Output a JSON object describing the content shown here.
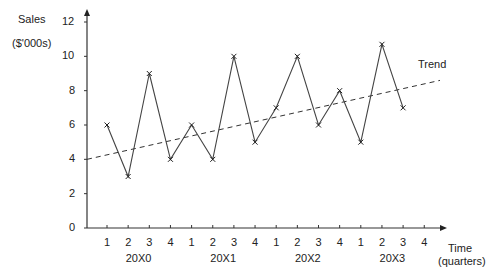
{
  "chart_data": {
    "type": "line",
    "title": "",
    "ylabel": "Sales",
    "ylabel_unit": "($'000s)",
    "xlabel": "Time",
    "xlabel_unit": "(quarters)",
    "ylim": [
      0,
      12
    ],
    "yticks": [
      0,
      2,
      4,
      6,
      8,
      10,
      12
    ],
    "quarters": [
      "1",
      "2",
      "3",
      "4",
      "1",
      "2",
      "3",
      "4",
      "1",
      "2",
      "3",
      "4",
      "1",
      "2",
      "3",
      "4"
    ],
    "years": [
      "20X0",
      "20X1",
      "20X2",
      "20X3"
    ],
    "series": [
      {
        "name": "Sales",
        "marker": "x",
        "values": [
          6,
          3,
          9,
          4,
          6,
          4,
          10,
          5,
          7,
          10,
          6,
          8,
          5,
          10.7,
          7
        ]
      },
      {
        "name": "Trend",
        "style": "dashed",
        "start": 4.0,
        "end": 8.6
      }
    ],
    "annotations": [
      "Trend"
    ],
    "grid": false,
    "legend": "none"
  }
}
